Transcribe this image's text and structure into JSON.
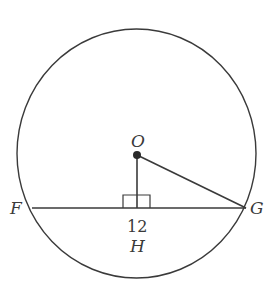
{
  "diagram": {
    "type": "circle-chord-geometry",
    "colors": {
      "stroke": "#3a3a3a",
      "background": "#ffffff"
    },
    "circle": {
      "cx": 136.5,
      "cy": 153.5,
      "rx": 119.5,
      "ry": 124.5
    },
    "points": {
      "O": {
        "label": "O",
        "x": 137,
        "y": 155
      },
      "F": {
        "label": "F",
        "x": 32,
        "y": 208
      },
      "G": {
        "label": "G",
        "x": 246,
        "y": 208
      },
      "H": {
        "label": "H",
        "x": 137,
        "y": 208
      }
    },
    "segments": [
      {
        "from": "F",
        "to": "G",
        "name": "chord-FG"
      },
      {
        "from": "O",
        "to": "H",
        "name": "segment-OH"
      },
      {
        "from": "O",
        "to": "G",
        "name": "radius-OG"
      }
    ],
    "right_angle_marker": {
      "at": "H",
      "x": 123,
      "y": 195,
      "width": 27,
      "height": 13
    },
    "measurements": {
      "FG_label": "12"
    },
    "labels": {
      "O": "O",
      "F": "F",
      "G": "G",
      "H": "H",
      "length": "12"
    }
  }
}
